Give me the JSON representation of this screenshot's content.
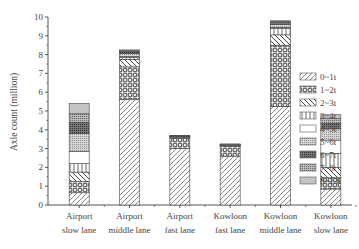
{
  "chart_data": {
    "type": "bar",
    "stacked": true,
    "title": "",
    "xlabel": "",
    "ylabel": "Axle count (million)",
    "ylim": [
      0,
      10
    ],
    "yticks": [
      0,
      1,
      2,
      3,
      4,
      5,
      6,
      7,
      8,
      9,
      10
    ],
    "grid": false,
    "legend_position": "right",
    "categories": [
      [
        "Airport",
        "slow lane"
      ],
      [
        "Airport",
        "middle lane"
      ],
      [
        "Airport",
        "fast lane"
      ],
      [
        "Kowloon",
        "fast lane"
      ],
      [
        "Kowloon",
        "middle lane"
      ],
      [
        "Kowloon",
        "slow lane"
      ]
    ],
    "series": [
      {
        "name": "0~1t",
        "pattern": "diag-fwd",
        "values": [
          0.65,
          5.6,
          3.0,
          2.6,
          5.25,
          0.85
        ]
      },
      {
        "name": "1~2t",
        "pattern": "circles",
        "values": [
          0.6,
          1.75,
          0.55,
          0.55,
          3.25,
          0.6
        ]
      },
      {
        "name": "2~3t",
        "pattern": "diag-back",
        "values": [
          0.5,
          0.4,
          0.05,
          0.02,
          0.55,
          0.55
        ]
      },
      {
        "name": "3~4t",
        "pattern": "vlines",
        "values": [
          0.45,
          0.1,
          0.02,
          0.01,
          0.35,
          0.75
        ]
      },
      {
        "name": "4~5t",
        "pattern": "blank",
        "values": [
          0.65,
          0.05,
          0.01,
          0.01,
          0.05,
          0.7
        ]
      },
      {
        "name": "5~6t",
        "pattern": "dots-light",
        "values": [
          0.95,
          0.15,
          0.01,
          0.01,
          0.15,
          0.6
        ]
      },
      {
        "name": "6~7t",
        "pattern": "dots-dark",
        "values": [
          0.6,
          0.1,
          0.03,
          0.02,
          0.1,
          0.3
        ]
      },
      {
        "name": "7~8t",
        "pattern": "dots-mid",
        "values": [
          0.45,
          0.05,
          0.01,
          0.01,
          0.05,
          0.25
        ]
      },
      {
        "name": "8~13t",
        "pattern": "vlines-dense",
        "values": [
          0.55,
          0.05,
          0.02,
          0.02,
          0.05,
          0.2
        ]
      }
    ],
    "totals": [
      5.4,
      8.25,
      3.7,
      3.25,
      9.8,
      4.8
    ]
  }
}
